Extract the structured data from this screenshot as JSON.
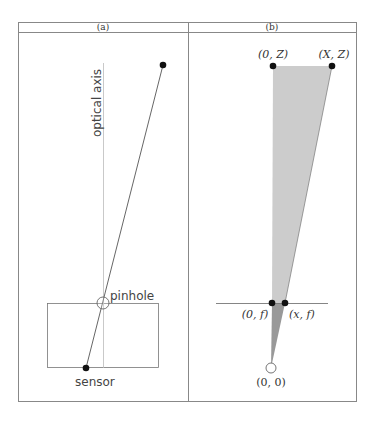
{
  "figure": {
    "panels": [
      {
        "id": "a",
        "header": "(a)",
        "labels": {
          "optical_axis": "optical axis",
          "pinhole": "pinhole",
          "sensor": "sensor"
        }
      },
      {
        "id": "b",
        "header": "(b)",
        "labels": {
          "top_left": "(0, Z)",
          "top_right": "(X, Z)",
          "image_left": "(0, f)",
          "image_right": "(x, f)",
          "origin": "(0, 0)"
        }
      }
    ],
    "colors": {
      "frame": "#888888",
      "light_fill": "#cccccc",
      "dark_fill": "#999999",
      "dot": "#111111",
      "axis_line": "#bbbbbb"
    }
  }
}
